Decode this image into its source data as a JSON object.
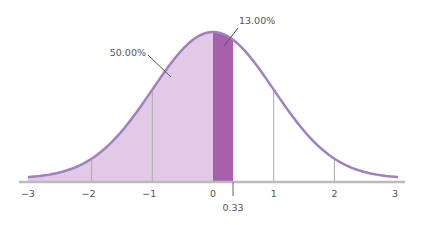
{
  "chart_data": {
    "type": "area",
    "title": "",
    "subtitle": "",
    "xlabel": "",
    "ylabel": "",
    "xlim": [
      -3,
      3
    ],
    "x_ticks": [
      -3,
      -2,
      -1,
      0,
      1,
      2,
      3
    ],
    "x_tick_labels": [
      "−3",
      "−2",
      "−1",
      "0",
      "1",
      "2",
      "3"
    ],
    "grid": false,
    "legend": null,
    "distribution": {
      "name": "standard normal",
      "mean": 0,
      "sd": 1
    },
    "shaded_regions": [
      {
        "from": -3,
        "to": 0,
        "area_label": "50.00%",
        "color": "#e2c9e6"
      },
      {
        "from": 0,
        "to": 0.33,
        "area_label": "13.00%",
        "color": "#a760ab"
      }
    ],
    "reference_lines_x": [
      -2,
      -1,
      1,
      2
    ],
    "marker": {
      "x": 0.33,
      "label": "0.33"
    },
    "annotations": [
      {
        "text": "50.00%",
        "points_to_x": -0.6
      },
      {
        "text": "13.00%",
        "points_to_x": 0.17
      }
    ],
    "colors": {
      "curve": "#a17fc0",
      "light_fill": "#e2c9e6",
      "dark_fill": "#a760ab",
      "axis": "#bbbbbb",
      "ref_lines": "#aaaaaa",
      "text": "#555555"
    }
  },
  "labels": {
    "left_area": "50.00%",
    "band_area": "13.00%",
    "marker": "0.33",
    "ticks": [
      "−3",
      "−2",
      "−1",
      "0",
      "1",
      "2",
      "3"
    ]
  }
}
